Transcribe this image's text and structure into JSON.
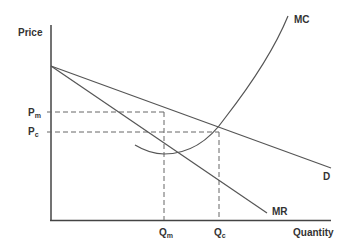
{
  "diagram": {
    "axes": {
      "y_label": "Price",
      "x_label": "Quantity"
    },
    "curves": {
      "mc": {
        "label": "MC"
      },
      "demand": {
        "label": "D"
      },
      "mr": {
        "label": "MR"
      }
    },
    "price_levels": {
      "pm": {
        "main": "P",
        "sub": "m"
      },
      "pc": {
        "main": "P",
        "sub": "c"
      }
    },
    "quantity_levels": {
      "qm": {
        "main": "Q",
        "sub": "m"
      },
      "qc": {
        "main": "Q",
        "sub": "c"
      }
    },
    "colors": {
      "axis": "#444444",
      "curve": "#555555",
      "dashed": "#666666",
      "text": "#333333"
    }
  }
}
